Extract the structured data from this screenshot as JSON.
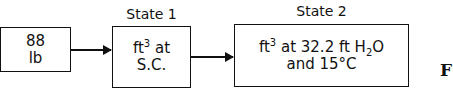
{
  "diagram": {
    "nodes": [
      {
        "id": "mass",
        "line1": "88",
        "line2": "lb"
      },
      {
        "id": "state1",
        "title": "State 1",
        "line1_base": "ft",
        "line1_sup": "3",
        "line1_rest": " at",
        "line2": "S.C."
      },
      {
        "id": "state2",
        "title": "State 2",
        "line1_base": "ft",
        "line1_sup": "3",
        "line1_mid": " at 32.2 ft H",
        "line1_sub": "2",
        "line1_end": "O",
        "line2": "and 15°C"
      }
    ],
    "edges": [
      {
        "from": "mass",
        "to": "state1"
      },
      {
        "from": "state1",
        "to": "state2"
      }
    ],
    "caption_fragment": "F"
  }
}
